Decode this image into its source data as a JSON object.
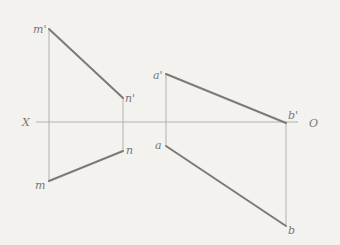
{
  "axis": {
    "left_label": "X",
    "right_label": "O"
  },
  "figure_left": {
    "points": {
      "m_prime": "m'",
      "n_prime": "n'",
      "n": "n",
      "m": "m"
    }
  },
  "figure_right": {
    "points": {
      "a_prime": "a'",
      "b_prime": "b'",
      "a": "a",
      "b": "b"
    }
  },
  "colors": {
    "background": "#f3f2ef",
    "thin_line": "#a8a8a8",
    "thick_line": "#7a7a7a",
    "label": "#777777"
  }
}
